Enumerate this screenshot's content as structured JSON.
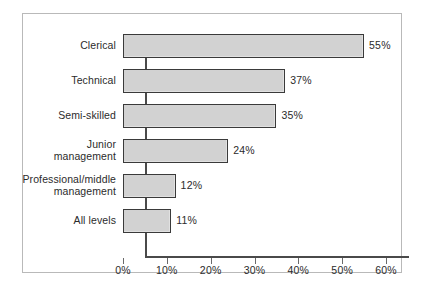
{
  "chart_data": {
    "type": "bar",
    "orientation": "horizontal",
    "title": "",
    "xlabel": "",
    "ylabel": "",
    "xlim": [
      0,
      60
    ],
    "grid": false,
    "legend": null,
    "categories": [
      "Clerical",
      "Technical",
      "Semi-skilled",
      "Junior\nmanagement",
      "Professional/middle\nmanagement",
      "All levels"
    ],
    "values": [
      55,
      37,
      35,
      24,
      12,
      11
    ],
    "value_labels": [
      "55%",
      "37%",
      "35%",
      "24%",
      "12%",
      "11%"
    ],
    "xticks": [
      0,
      10,
      20,
      30,
      40,
      50,
      60
    ],
    "xtick_labels": [
      "0%",
      "10%",
      "20%",
      "30%",
      "40%",
      "50%",
      "60%"
    ],
    "colors": {
      "bar_fill": "#d2d2d2",
      "bar_border": "#3a3a3a",
      "axis": "#4a4a4a",
      "frame": "#b9b9b9",
      "text": "#2b2b2b",
      "background": "#ffffff"
    }
  }
}
